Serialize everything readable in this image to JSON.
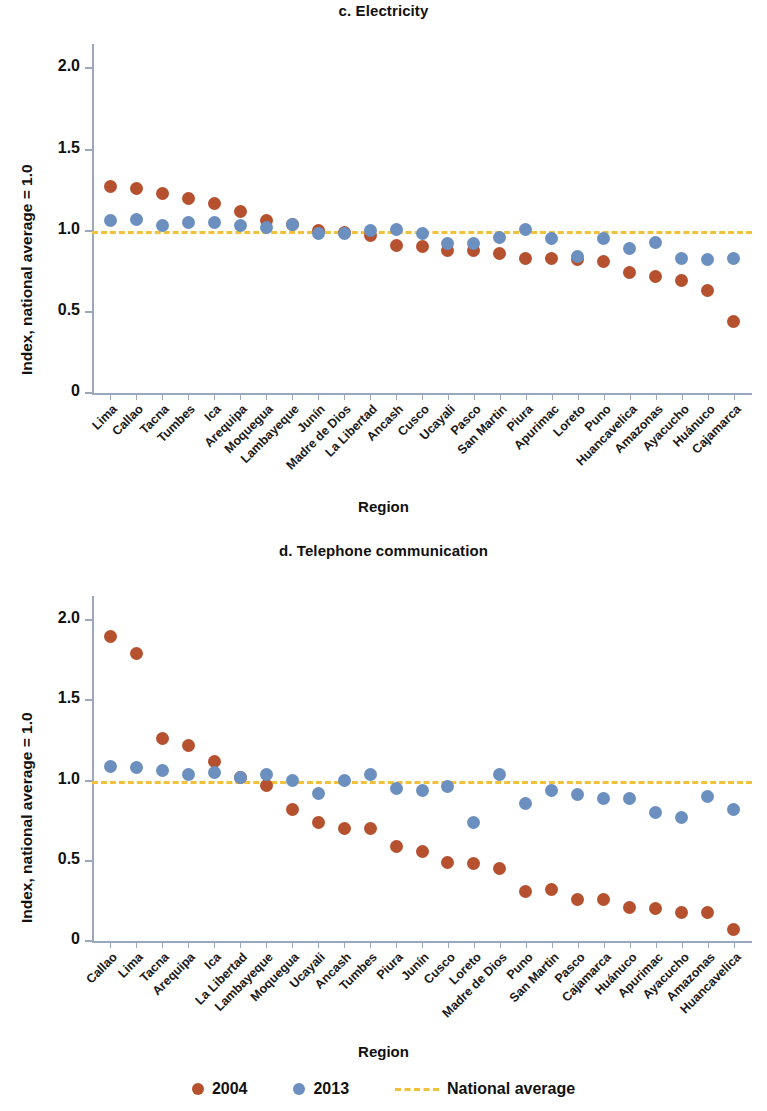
{
  "figure": {
    "x_axis_title": "Region",
    "y_axis_title": "Index, national average = 1.0",
    "legend": {
      "series_2004_label": "2004",
      "series_2013_label": "2013",
      "national_average_label": "National average",
      "color_2004": "#b5512f",
      "color_2013": "#6b8fbe",
      "color_national_average": "#f0c23c"
    }
  },
  "chart_data": [
    {
      "type": "scatter",
      "title": "c. Electricity",
      "xlabel": "Region",
      "ylabel": "Index, national average = 1.0",
      "ylim": [
        0,
        2.15
      ],
      "yticks": [
        0,
        0.5,
        1.0,
        1.5,
        2.0
      ],
      "ytick_labels": [
        "0",
        "0.5",
        "1.0",
        "1.5",
        "2.0"
      ],
      "grid": false,
      "legend_position": "below-figure",
      "reference_line": {
        "label": "National average",
        "value": 1.0,
        "style": "dashed",
        "color": "#f0c23c"
      },
      "categories": [
        "Lima",
        "Callao",
        "Tacna",
        "Tumbes",
        "Ica",
        "Arequipa",
        "Moquegua",
        "Lambayeque",
        "Junín",
        "Madre de Dios",
        "La Libertad",
        "Ancash",
        "Cusco",
        "Ucayali",
        "Pasco",
        "San Martin",
        "Piura",
        "Apurimac",
        "Loreto",
        "Puno",
        "Huancavelica",
        "Amazonas",
        "Ayacucho",
        "Huánuco",
        "Cajamarca"
      ],
      "series": [
        {
          "name": "2004",
          "color": "#b5512f",
          "values": [
            1.27,
            1.26,
            1.23,
            1.2,
            1.17,
            1.12,
            1.06,
            1.04,
            1.0,
            0.99,
            0.97,
            0.91,
            0.9,
            0.88,
            0.88,
            0.86,
            0.83,
            0.83,
            0.82,
            0.81,
            0.74,
            0.72,
            0.69,
            0.63,
            0.44
          ]
        },
        {
          "name": "2013",
          "color": "#6b8fbe",
          "values": [
            1.06,
            1.07,
            1.03,
            1.05,
            1.05,
            1.03,
            1.02,
            1.04,
            0.98,
            0.98,
            1.0,
            1.01,
            0.98,
            0.92,
            0.92,
            0.96,
            1.01,
            0.95,
            0.84,
            0.95,
            0.89,
            0.93,
            0.83,
            0.82,
            0.83
          ]
        }
      ]
    },
    {
      "type": "scatter",
      "title": "d. Telephone communication",
      "xlabel": "Region",
      "ylabel": "Index, national average = 1.0",
      "ylim": [
        0,
        2.15
      ],
      "yticks": [
        0,
        0.5,
        1.0,
        1.5,
        2.0
      ],
      "ytick_labels": [
        "0",
        "0.5",
        "1.0",
        "1.5",
        "2.0"
      ],
      "grid": false,
      "legend_position": "below-figure",
      "reference_line": {
        "label": "National average",
        "value": 1.0,
        "style": "dashed",
        "color": "#f0c23c"
      },
      "categories": [
        "Callao",
        "Lima",
        "Tacna",
        "Arequipa",
        "Ica",
        "La Libertad",
        "Lambayeque",
        "Moquegua",
        "Ucayali",
        "Ancash",
        "Tumbes",
        "Piura",
        "Junín",
        "Cusco",
        "Loreto",
        "Madre de Dios",
        "Puno",
        "San Martin",
        "Pasco",
        "Cajamarca",
        "Huánuco",
        "Apurimac",
        "Ayacucho",
        "Amazonas",
        "Huancavelica"
      ],
      "series": [
        {
          "name": "2004",
          "color": "#b5512f",
          "values": [
            1.9,
            1.79,
            1.26,
            1.22,
            1.12,
            1.02,
            0.97,
            0.82,
            0.74,
            0.7,
            0.7,
            0.59,
            0.56,
            0.49,
            0.48,
            0.45,
            0.31,
            0.32,
            0.26,
            0.26,
            0.21,
            0.2,
            0.18,
            0.18,
            0.07
          ]
        },
        {
          "name": "2013",
          "color": "#6b8fbe",
          "values": [
            1.09,
            1.08,
            1.06,
            1.04,
            1.05,
            1.02,
            1.04,
            1.0,
            0.92,
            1.0,
            1.04,
            0.95,
            0.94,
            0.96,
            0.74,
            1.04,
            0.86,
            0.94,
            0.91,
            0.89,
            0.89,
            0.8,
            0.77,
            0.9,
            0.82
          ]
        }
      ]
    }
  ]
}
